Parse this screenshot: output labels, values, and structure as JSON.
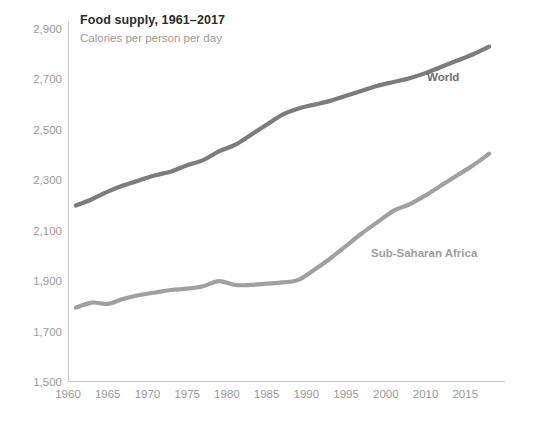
{
  "chart_data": {
    "type": "line",
    "title": "Food supply, 1961–2017",
    "subtitle": "Calories per person per day",
    "xlabel": "",
    "ylabel": "",
    "xlim": [
      1960,
      2015
    ],
    "ylim": [
      1500,
      2900
    ],
    "grid": false,
    "legend_position": "inline-end-of-line",
    "x_tick_labels": [
      "1960",
      "1965",
      "1970",
      "1975",
      "1980",
      "1985",
      "1990",
      "1995",
      "2000",
      "2010",
      "2015"
    ],
    "x_tick_values": [
      1960,
      1965,
      1970,
      1975,
      1980,
      1985,
      1990,
      1995,
      2000,
      2005,
      2010
    ],
    "y_tick_labels": [
      "2,900",
      "2,700",
      "2,500",
      "2,300",
      "2,100",
      "1,900",
      "1,700",
      "1,500"
    ],
    "y_tick_values": [
      2900,
      2700,
      2500,
      2300,
      2100,
      1900,
      1700,
      1500
    ],
    "x": [
      1961,
      1963,
      1965,
      1967,
      1969,
      1971,
      1973,
      1975,
      1977,
      1979,
      1981,
      1983,
      1985,
      1987,
      1989,
      1991,
      1993,
      1995,
      1997,
      1999,
      2001,
      2003,
      2005,
      2007,
      2009,
      2011,
      2013
    ],
    "series": [
      {
        "name": "World",
        "color": "#7c7c7c",
        "values": [
          2200,
          2225,
          2255,
          2280,
          2300,
          2320,
          2335,
          2360,
          2380,
          2415,
          2440,
          2480,
          2520,
          2560,
          2585,
          2600,
          2615,
          2635,
          2655,
          2675,
          2690,
          2705,
          2725,
          2750,
          2775,
          2800,
          2830
        ]
      },
      {
        "name": "Sub-Saharan Africa",
        "color": "#a0a0a0",
        "values": [
          1795,
          1815,
          1810,
          1830,
          1845,
          1855,
          1865,
          1870,
          1880,
          1900,
          1885,
          1885,
          1890,
          1895,
          1905,
          1945,
          1990,
          2040,
          2090,
          2135,
          2180,
          2205,
          2240,
          2280,
          2320,
          2360,
          2405
        ]
      }
    ]
  },
  "labels": {
    "world": "World",
    "ssa": "Sub-Saharan Africa"
  }
}
